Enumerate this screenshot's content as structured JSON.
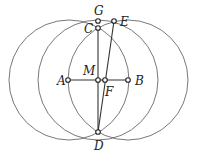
{
  "diagram": {
    "type": "geometric-construction",
    "circles": [
      {
        "name": "circle-center-A",
        "cx": 69,
        "cy": 80,
        "r": 60
      },
      {
        "name": "circle-center-M",
        "cx": 98,
        "cy": 80,
        "r": 60
      },
      {
        "name": "circle-center-B",
        "cx": 128,
        "cy": 80,
        "r": 60
      }
    ],
    "points": [
      {
        "label": "A",
        "x": 68,
        "y": 80,
        "lx": 57,
        "ly": 85
      },
      {
        "label": "M",
        "x": 98,
        "y": 80,
        "lx": 83,
        "ly": 75
      },
      {
        "label": "F",
        "x": 105,
        "y": 80,
        "lx": 105,
        "ly": 96
      },
      {
        "label": "B",
        "x": 128,
        "y": 80,
        "lx": 135,
        "ly": 85
      },
      {
        "label": "G",
        "x": 98,
        "y": 21,
        "lx": 94,
        "ly": 15
      },
      {
        "label": "C",
        "x": 98,
        "y": 28,
        "lx": 84,
        "ly": 33
      },
      {
        "label": "E",
        "x": 114,
        "y": 21,
        "lx": 120,
        "ly": 26
      },
      {
        "label": "D",
        "x": 98,
        "y": 132,
        "lx": 94,
        "ly": 150
      }
    ],
    "segments": [
      {
        "from": "A",
        "to": "B"
      },
      {
        "from": "C",
        "to": "D"
      },
      {
        "from": "E",
        "to": "D"
      }
    ]
  }
}
